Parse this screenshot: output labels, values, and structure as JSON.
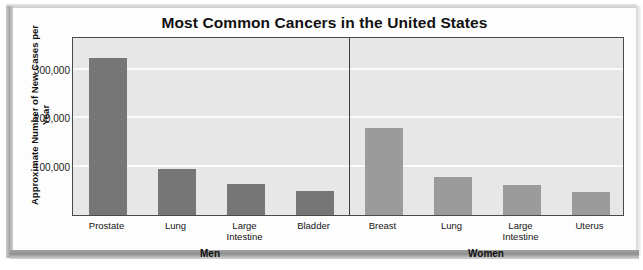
{
  "figure": {
    "title": "Most Common Cancers in the United States"
  },
  "chart_data": {
    "type": "bar",
    "title": "Most Common Cancers in the United States",
    "xlabel": "",
    "ylabel": "Approximate Number of New Cases per Year",
    "ylim": [
      0,
      370000
    ],
    "yticks": [
      100000,
      200000,
      300000
    ],
    "ytick_labels": [
      "100,000",
      "200,000",
      "300,000"
    ],
    "grid": true,
    "legend": "none",
    "panels": [
      {
        "name": "Men",
        "label": "Men",
        "bar_color": "#767676",
        "categories": [
          "Prostate",
          "Lung",
          "Large Intestine",
          "Bladder"
        ],
        "category_lines": [
          [
            "Prostate"
          ],
          [
            "Lung"
          ],
          [
            "Large",
            "Intestine"
          ],
          [
            "Bladder"
          ]
        ],
        "values": [
          325000,
          95000,
          65000,
          50000
        ]
      },
      {
        "name": "Women",
        "label": "Women",
        "bar_color": "#9b9b9b",
        "categories": [
          "Breast",
          "Lung",
          "Large Intestine",
          "Uterus"
        ],
        "category_lines": [
          [
            "Breast"
          ],
          [
            "Lung"
          ],
          [
            "Large",
            "Intestine"
          ],
          [
            "Uterus"
          ]
        ],
        "values": [
          180000,
          78000,
          62000,
          48000
        ]
      }
    ]
  },
  "colors": {
    "plot_background": "#e7e7e7",
    "gridline": "#fbfbfb",
    "axis": "#4a4a4a",
    "men_bar": "#767676",
    "women_bar": "#9b9b9b",
    "text": "#111111"
  }
}
